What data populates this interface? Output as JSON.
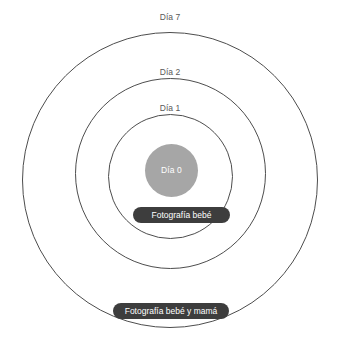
{
  "diagram": {
    "type": "concentric-timeline",
    "background_color": "#ffffff",
    "rings": [
      {
        "id": "outer",
        "label": "Día 7",
        "day": 7,
        "stroke_color": "#4d4d4d",
        "fill": "none"
      },
      {
        "id": "middle",
        "label": "Día 2",
        "day": 2,
        "stroke_color": "#4d4d4d",
        "fill": "none"
      },
      {
        "id": "inner",
        "label": "Día 1",
        "day": 1,
        "stroke_color": "#4d4d4d",
        "fill": "none"
      }
    ],
    "core": {
      "label": "Día 0",
      "day": 0,
      "fill_color": "#a6a6a6",
      "text_color": "#ffffff"
    },
    "label_color": "#595959",
    "callouts": [
      {
        "id": "baby-photo",
        "text": "Fotografía bebé",
        "background_color": "#3d3d3d",
        "text_color": "#ffffff"
      },
      {
        "id": "baby-and-mom-photo",
        "text": "Fotografía bebé y mamá",
        "background_color": "#3d3d3d",
        "text_color": "#ffffff"
      }
    ]
  }
}
